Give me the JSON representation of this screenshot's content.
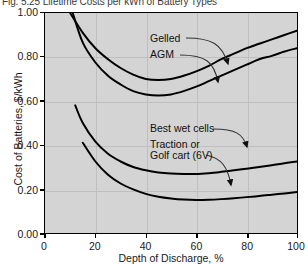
{
  "figure": {
    "title": "Fig. 5.25 Lifetime Costs per kWh of Battery Types"
  },
  "chart_data": {
    "type": "line",
    "title": "Fig. 5.25 Lifetime Costs per kWh of Battery Types",
    "xlabel": "Depth of Discharge, %",
    "ylabel": "Cost of Batteries, $/kWh",
    "xlim": [
      0,
      100
    ],
    "ylim": [
      0.0,
      1.0
    ],
    "xticks": [
      "0",
      "20",
      "40",
      "60",
      "80",
      "100"
    ],
    "yticks": [
      "0.00",
      "0.20",
      "0.40",
      "0.60",
      "0.80",
      "1.00"
    ],
    "grid": true,
    "legend_position": "inline-annotations",
    "plot_background": "#d4d4d4",
    "line_color": "#000000",
    "series": [
      {
        "name": "Gelled",
        "label_position": {
          "x": 47,
          "y": 0.84
        },
        "x": [
          10,
          15,
          20,
          25,
          30,
          35,
          40,
          45,
          50,
          55,
          60,
          65,
          70,
          75,
          80,
          85,
          90,
          95,
          100
        ],
        "y": [
          1.0,
          0.91,
          0.84,
          0.79,
          0.75,
          0.72,
          0.7,
          0.695,
          0.7,
          0.715,
          0.735,
          0.76,
          0.79,
          0.815,
          0.84,
          0.86,
          0.88,
          0.9,
          0.92
        ]
      },
      {
        "name": "AGM",
        "label_position": {
          "x": 42,
          "y": 0.775
        },
        "x": [
          11,
          15,
          20,
          25,
          30,
          35,
          40,
          45,
          50,
          55,
          60,
          65,
          70,
          75,
          80,
          85,
          90,
          95,
          100
        ],
        "y": [
          1.0,
          0.865,
          0.775,
          0.715,
          0.675,
          0.645,
          0.63,
          0.625,
          0.63,
          0.645,
          0.665,
          0.69,
          0.715,
          0.74,
          0.765,
          0.79,
          0.805,
          0.825,
          0.84
        ]
      },
      {
        "name": "Best wet cells",
        "label_position": {
          "x": 40,
          "y": 0.4
        },
        "x": [
          12,
          15,
          20,
          25,
          30,
          35,
          40,
          45,
          50,
          55,
          60,
          65,
          70,
          75,
          80,
          85,
          90,
          95,
          100
        ],
        "y": [
          0.58,
          0.5,
          0.415,
          0.36,
          0.325,
          0.3,
          0.285,
          0.275,
          0.27,
          0.268,
          0.268,
          0.272,
          0.278,
          0.285,
          0.292,
          0.3,
          0.308,
          0.317,
          0.325
        ]
      },
      {
        "name": "Traction or Golf cart (6V)",
        "label_position": {
          "x": 40,
          "y": 0.265
        },
        "x": [
          15,
          20,
          25,
          30,
          35,
          40,
          45,
          50,
          55,
          60,
          65,
          70,
          75,
          80,
          85,
          90,
          95,
          100
        ],
        "y": [
          0.41,
          0.325,
          0.265,
          0.225,
          0.198,
          0.178,
          0.165,
          0.157,
          0.152,
          0.15,
          0.151,
          0.154,
          0.158,
          0.163,
          0.168,
          0.174,
          0.18,
          0.186
        ]
      }
    ],
    "annotations": [
      {
        "text": "Gelled",
        "x": 150,
        "y": 38
      },
      {
        "text": "AGM",
        "x": 150,
        "y": 52
      },
      {
        "text": "Best wet cells",
        "x": 150,
        "y": 127
      },
      {
        "text": "Traction or",
        "x": 150,
        "y": 142
      },
      {
        "text": "Golf cart (6V)",
        "x": 150,
        "y": 153
      }
    ]
  }
}
